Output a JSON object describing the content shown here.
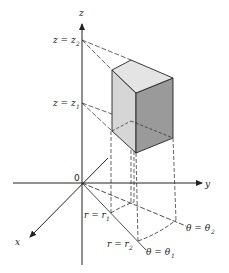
{
  "figure": {
    "axes": {
      "z": "z",
      "y": "y",
      "x": "x",
      "origin": "0"
    },
    "labels": {
      "z2": {
        "main": "z = z",
        "sub": "2"
      },
      "z1": {
        "main": "z = z",
        "sub": "1"
      },
      "r1": {
        "main": "r = r",
        "sub": "1"
      },
      "r2": {
        "main": "r = r",
        "sub": "2"
      },
      "theta1": {
        "main": "θ = θ",
        "sub": "1"
      },
      "theta2": {
        "main": "θ = θ",
        "sub": "2"
      }
    },
    "colors": {
      "line": "#222222",
      "face_light": "#e2e2e2",
      "face_mid": "#d2d2d2",
      "face_dark": "#9a9a9a"
    }
  }
}
